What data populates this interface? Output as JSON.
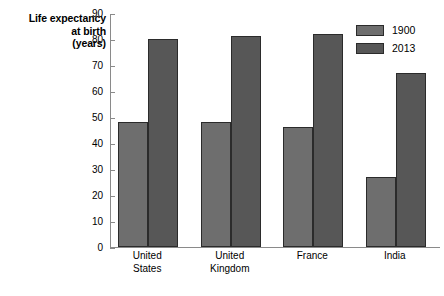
{
  "chart_data": {
    "type": "bar",
    "title": "",
    "subtitle": "",
    "xlabel": "",
    "ylabel": "Life expectancy at birth (years)",
    "ylabel_lines": [
      "Life expectancy",
      "at birth",
      "(years)"
    ],
    "categories": [
      "United States",
      "United Kingdom",
      "France",
      "India"
    ],
    "category_lines": [
      [
        "United",
        "States"
      ],
      [
        "United",
        "Kingdom"
      ],
      [
        "France"
      ],
      [
        "India"
      ]
    ],
    "series": [
      {
        "name": "1900",
        "color": "#6e6e6e",
        "values": [
          48,
          48,
          46,
          27
        ]
      },
      {
        "name": "2013",
        "color": "#575757",
        "values": [
          80,
          81,
          82,
          67
        ]
      }
    ],
    "ylim": [
      0,
      90
    ],
    "yticks": [
      0,
      10,
      20,
      30,
      40,
      50,
      60,
      70,
      80,
      90
    ],
    "ytick_labels": [
      "0",
      "10",
      "20",
      "30",
      "40",
      "50",
      "60",
      "70",
      "80",
      "90"
    ],
    "grid": false,
    "legend_position": "top-right",
    "axis_color": "#8a8a8a",
    "bar_edge_color": "#2b2b2b",
    "background": "#ffffff"
  },
  "legend": {
    "entries": [
      {
        "label": "1900",
        "color": "#6e6e6e"
      },
      {
        "label": "2013",
        "color": "#575757"
      }
    ]
  }
}
